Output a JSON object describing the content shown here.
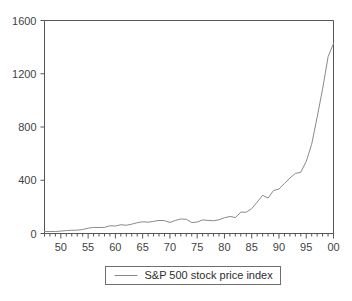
{
  "chart_data": {
    "type": "line",
    "title": "",
    "subtitle": "",
    "xlabel": "",
    "ylabel": "",
    "xlim": [
      1947,
      2000
    ],
    "ylim": [
      0,
      1600
    ],
    "grid": false,
    "legend_position": "below-center",
    "y_ticks": [
      0,
      400,
      800,
      1200,
      1600
    ],
    "y_tick_labels": [
      "0",
      "400",
      "800",
      "1200",
      "1600"
    ],
    "x_ticks": [
      1950,
      1955,
      1960,
      1965,
      1970,
      1975,
      1980,
      1985,
      1990,
      1995,
      2000
    ],
    "x_tick_labels": [
      "50",
      "55",
      "60",
      "65",
      "70",
      "75",
      "80",
      "85",
      "90",
      "95",
      "00"
    ],
    "x_minor_tick_interval": 1,
    "series": [
      {
        "name": "S&P 500 stock price index",
        "color": "#8a8a8a",
        "x": [
          1947,
          1948,
          1949,
          1950,
          1951,
          1952,
          1953,
          1954,
          1955,
          1956,
          1957,
          1958,
          1959,
          1960,
          1961,
          1962,
          1963,
          1964,
          1965,
          1966,
          1967,
          1968,
          1969,
          1970,
          1971,
          1972,
          1973,
          1974,
          1975,
          1976,
          1977,
          1978,
          1979,
          1980,
          1981,
          1982,
          1983,
          1984,
          1985,
          1986,
          1987,
          1988,
          1989,
          1990,
          1991,
          1992,
          1993,
          1994,
          1995,
          1996,
          1997,
          1998,
          1999,
          2000
        ],
        "values": [
          15,
          15,
          15,
          18,
          22,
          24,
          25,
          30,
          40,
          46,
          45,
          46,
          58,
          56,
          66,
          62,
          70,
          81,
          88,
          85,
          91,
          98,
          97,
          83,
          98,
          109,
          107,
          82,
          86,
          102,
          98,
          96,
          103,
          118,
          128,
          120,
          160,
          160,
          187,
          236,
          287,
          266,
          323,
          334,
          376,
          416,
          451,
          460,
          542,
          671,
          873,
          1085,
          1327,
          1427
        ]
      }
    ],
    "legend": [
      {
        "label": "S&P 500 stock price index",
        "color": "#8a8a8a"
      }
    ],
    "colors": {
      "axis": "#555555",
      "line": "#8a8a8a",
      "legend_border": "#6e6e6e",
      "text": "#3a3a3a",
      "background": "#ffffff"
    }
  }
}
